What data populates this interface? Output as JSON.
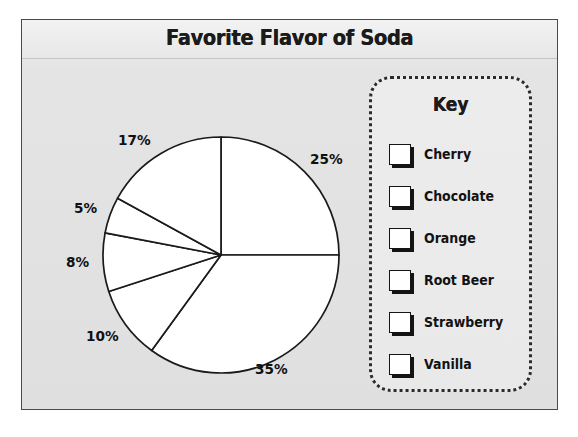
{
  "title": "Favorite Flavor of Soda",
  "key": {
    "heading": "Key",
    "items": [
      {
        "label": "Cherry",
        "swatch": "swatch-white-square"
      },
      {
        "label": "Chocolate",
        "swatch": "swatch-white-square"
      },
      {
        "label": "Orange",
        "swatch": "swatch-white-square"
      },
      {
        "label": "Root Beer",
        "swatch": "swatch-white-square"
      },
      {
        "label": "Strawberry",
        "swatch": "swatch-white-square"
      },
      {
        "label": "Vanilla",
        "swatch": "swatch-white-square"
      }
    ]
  },
  "colors": {
    "frame_border": "#4a4a4a",
    "frame_background": "#e3e3e3",
    "pie_fill": "#ffffff",
    "pie_stroke": "#1a1a1a",
    "text": "#111111",
    "key_border": "#2b2b2b"
  },
  "pie_geometry": {
    "center_x": 199,
    "center_y": 235,
    "radius": 118,
    "start_angle_deg": 0,
    "direction": "clockwise"
  },
  "labels": {
    "cherry": "25%",
    "chocolate": "35%",
    "orange": "10%",
    "root_beer": "8%",
    "strawberry": "5%",
    "vanilla": "17%"
  },
  "chart_data": {
    "type": "pie",
    "title": "Favorite Flavor of Soda",
    "xlabel": "",
    "ylabel": "",
    "legend_position": "right",
    "legend_title": "Key",
    "grid": false,
    "units": "percent",
    "total": 100,
    "categories": [
      "Cherry",
      "Chocolate",
      "Orange",
      "Root Beer",
      "Strawberry",
      "Vanilla"
    ],
    "values": [
      25,
      35,
      10,
      8,
      5,
      17
    ],
    "data_labels": [
      "25%",
      "35%",
      "10%",
      "8%",
      "5%",
      "17%"
    ],
    "slices": [
      {
        "label": "Cherry",
        "value": 25,
        "data_label": "25%",
        "start_deg": 0,
        "end_deg": 90,
        "fill": "#ffffff"
      },
      {
        "label": "Chocolate",
        "value": 35,
        "data_label": "35%",
        "start_deg": 90,
        "end_deg": 216,
        "fill": "#ffffff"
      },
      {
        "label": "Orange",
        "value": 10,
        "data_label": "10%",
        "start_deg": 216,
        "end_deg": 252,
        "fill": "#ffffff"
      },
      {
        "label": "Root Beer",
        "value": 8,
        "data_label": "8%",
        "start_deg": 252,
        "end_deg": 280.8,
        "fill": "#ffffff"
      },
      {
        "label": "Strawberry",
        "value": 5,
        "data_label": "5%",
        "start_deg": 280.8,
        "end_deg": 298.8,
        "fill": "#ffffff"
      },
      {
        "label": "Vanilla",
        "value": 17,
        "data_label": "17%",
        "start_deg": 298.8,
        "end_deg": 360,
        "fill": "#ffffff"
      }
    ],
    "label_positions": [
      {
        "data_label": "25%",
        "x": 288,
        "y": 131
      },
      {
        "data_label": "35%",
        "x": 233,
        "y": 341
      },
      {
        "data_label": "10%",
        "x": 64,
        "y": 308
      },
      {
        "data_label": "8%",
        "x": 44,
        "y": 234
      },
      {
        "data_label": "5%",
        "x": 52,
        "y": 180
      },
      {
        "data_label": "17%",
        "x": 96,
        "y": 112
      }
    ]
  }
}
